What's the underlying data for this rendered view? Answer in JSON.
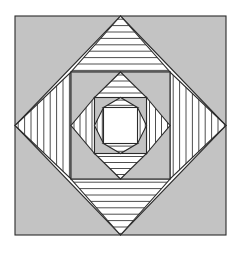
{
  "figure": {
    "canvas": {
      "width": 242,
      "height": 253,
      "background": "#ffffff"
    },
    "colors": {
      "background": "#ffffff",
      "fill_gray": "#c3c3c3",
      "fill_white": "#ffffff",
      "stroke": "#2b2b2b",
      "hatch_line": "#3a3a3a"
    },
    "stroke_width": 1.1,
    "hatch_line_width": 0.9,
    "outer_square": {
      "x": 15,
      "y": 16,
      "width": 211,
      "height": 219
    },
    "levels": [
      {
        "index": 0,
        "name": "level-1-outer",
        "square": {
          "cx": 120.5,
          "cy": 125.5,
          "half_w": 105.5,
          "half_h": 109.5
        },
        "square_fill": "#c3c3c3",
        "diamond_fill": "#ffffff",
        "hatch_spacing": 6.4,
        "top_hatch": "horizontal",
        "bottom_hatch": "horizontal",
        "left_hatch": "vertical",
        "right_hatch": "vertical"
      },
      {
        "index": 1,
        "name": "level-2",
        "square": {
          "cx": 120.5,
          "cy": 125.5,
          "half_w": 49.5,
          "half_h": 53.5
        },
        "square_fill": "#c3c3c3",
        "diamond_fill": "#ffffff",
        "hatch_spacing": 6.0,
        "top_hatch": "horizontal",
        "bottom_hatch": "horizontal",
        "left_hatch": "vertical",
        "right_hatch": "vertical"
      },
      {
        "index": 2,
        "name": "level-3",
        "square": {
          "cx": 120.5,
          "cy": 125.5,
          "half_w": 26.0,
          "half_h": 28.0
        },
        "square_fill": "#c3c3c3",
        "diamond_fill": "#ffffff",
        "hatch_spacing": 5.2,
        "top_hatch": "horizontal",
        "bottom_hatch": "horizontal",
        "left_hatch": "vertical",
        "right_hatch": "vertical"
      }
    ],
    "inner_square": {
      "name": "innermost-square",
      "cx": 120.5,
      "cy": 125.5,
      "half_w": 17.0,
      "half_h": 18.0,
      "fill": "#ffffff"
    }
  }
}
